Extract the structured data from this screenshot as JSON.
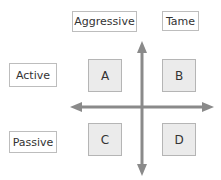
{
  "columns": [
    {
      "label": "Aggressive"
    },
    {
      "label": "Tame"
    }
  ],
  "rows": [
    {
      "label": "Active"
    },
    {
      "label": "Passive"
    }
  ],
  "quadrants": [
    {
      "id": "A"
    },
    {
      "id": "B"
    },
    {
      "id": "C"
    },
    {
      "id": "D"
    }
  ],
  "colors": {
    "axis": "#8a8a8a",
    "cell_fill": "#ebebeb",
    "border": "#bdbdbd"
  }
}
